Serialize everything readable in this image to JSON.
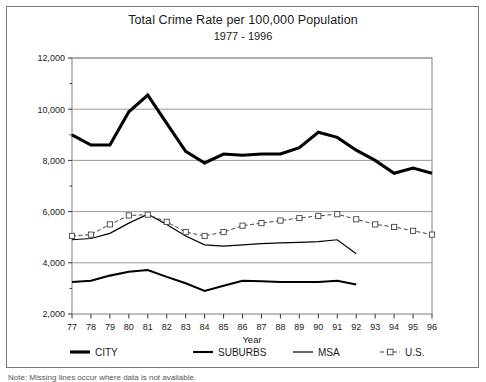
{
  "figure": {
    "note": "Note: Missing lines occur where data is not available."
  },
  "chart_data": {
    "type": "line",
    "title": "Total Crime Rate per 100,000 Population",
    "subtitle": "1977 - 1996",
    "xlabel": "Year",
    "ylabel": "",
    "grid": true,
    "legend_position": "bottom",
    "xlim": [
      1977,
      1996
    ],
    "ylim": [
      2000,
      12000
    ],
    "ytick_values": [
      2000,
      4000,
      6000,
      8000,
      10000,
      12000
    ],
    "ytick_labels": [
      "2,000",
      "4,000",
      "6,000",
      "8,000",
      "10,000",
      "12,000"
    ],
    "yminor_step": 1000,
    "x": [
      1977,
      1978,
      1979,
      1980,
      1981,
      1982,
      1983,
      1984,
      1985,
      1986,
      1987,
      1988,
      1989,
      1990,
      1991,
      1992,
      1993,
      1994,
      1995,
      1996
    ],
    "categories": [
      "77",
      "78",
      "79",
      "80",
      "81",
      "82",
      "83",
      "84",
      "85",
      "86",
      "87",
      "88",
      "89",
      "90",
      "91",
      "92",
      "93",
      "94",
      "95",
      "96"
    ],
    "series": [
      {
        "name": "CITY",
        "style": "solid",
        "width": 3.1,
        "color": "#000000",
        "marker": "none",
        "values": [
          9000,
          8600,
          8600,
          9900,
          10550,
          9450,
          8350,
          7900,
          8250,
          8200,
          8250,
          8250,
          8500,
          9100,
          8900,
          8400,
          8000,
          7500,
          7700,
          7500
        ]
      },
      {
        "name": "SUBURBS",
        "style": "solid",
        "width": 2.1,
        "color": "#000000",
        "marker": "none",
        "values": [
          3250,
          3300,
          3500,
          3650,
          3720,
          3450,
          3200,
          2900,
          3100,
          3300,
          3280,
          3250,
          3250,
          3250,
          3300,
          3150,
          null,
          null,
          null,
          null
        ]
      },
      {
        "name": "MSA",
        "style": "solid",
        "width": 1.2,
        "color": "#000000",
        "marker": "none",
        "values": [
          4900,
          4950,
          5150,
          5550,
          5900,
          5500,
          5050,
          4700,
          4650,
          4700,
          4750,
          4780,
          4800,
          4830,
          4900,
          4350,
          null,
          null,
          null,
          null
        ]
      },
      {
        "name": "U.S.",
        "style": "dashed",
        "width": 1.0,
        "color": "#444444",
        "marker": "square",
        "values": [
          5050,
          5100,
          5500,
          5850,
          5880,
          5600,
          5200,
          5050,
          5200,
          5450,
          5550,
          5650,
          5750,
          5830,
          5900,
          5700,
          5500,
          5400,
          5250,
          5100
        ]
      }
    ]
  }
}
